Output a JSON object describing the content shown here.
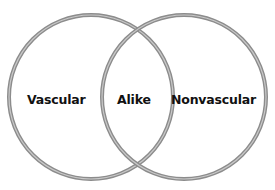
{
  "diagram": {
    "type": "venn",
    "sets": [
      {
        "id": "left",
        "label": "Vascular",
        "center": [
          91,
          97
        ],
        "radius": 82
      },
      {
        "id": "right",
        "label": "Nonvascular",
        "center": [
          184,
          97
        ],
        "radius": 82
      }
    ],
    "intersection": {
      "label": "Alike"
    },
    "colors": {
      "ring_outer": "#8c8c8c",
      "ring_highlight": "#c4c4c4",
      "text": "#111111",
      "background": "#ffffff"
    }
  }
}
